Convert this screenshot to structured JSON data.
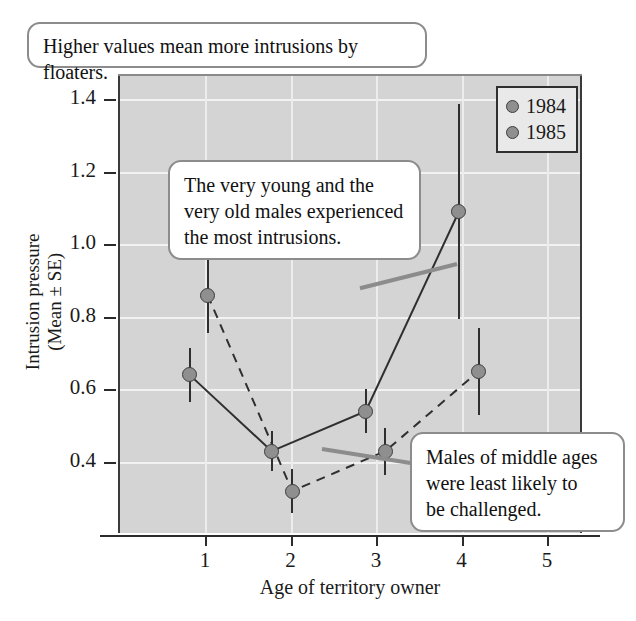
{
  "chart_data": {
    "type": "line",
    "title": "",
    "xlabel": "Age of territory owner",
    "ylabel": "Intrusion pressure\n(Mean ± SE)",
    "ylabel_line1": "Intrusion pressure",
    "ylabel_line2": "(Mean ± SE)",
    "x": [
      1,
      2,
      3,
      4
    ],
    "xticks": [
      "1",
      "2",
      "3",
      "4",
      "5"
    ],
    "yticks": [
      "1.4",
      "1.2",
      "1.0",
      "0.8",
      "0.6",
      "0.4"
    ],
    "xlim": [
      0.45,
      5.35
    ],
    "ylim": [
      0.26,
      1.47
    ],
    "grid": true,
    "legend_position": "top-right",
    "series": [
      {
        "name": "1984",
        "linestyle": "solid",
        "x": [
          0.82,
          1.78,
          2.88,
          3.97
        ],
        "values": [
          0.64,
          0.43,
          0.54,
          1.09
        ],
        "errors": [
          0.075,
          0.055,
          0.06,
          0.295
        ]
      },
      {
        "name": "1985",
        "linestyle": "dashed",
        "x": [
          1.03,
          2.02,
          3.11,
          4.2
        ],
        "values": [
          0.86,
          0.32,
          0.43,
          0.65
        ],
        "errors": [
          0.105,
          0.06,
          0.065,
          0.12
        ]
      }
    ],
    "annotations": [
      {
        "id": "title-callout",
        "text": "Higher values mean more intrusions by floaters."
      },
      {
        "id": "young-callout",
        "lines": [
          "The very young and the",
          "very old males experienced",
          "the most intrusions."
        ],
        "text": "The very young and the very old males experienced the most intrusions."
      },
      {
        "id": "middle-callout",
        "lines": [
          "Males of middle ages",
          "were least likely to",
          "be challenged."
        ],
        "text": "Males of middle ages were least likely to be challenged."
      }
    ],
    "colors": {
      "plot_background": "#d4d4d4",
      "marker_fill": "#8f8f8f",
      "marker_edge": "#3d3d3d",
      "line": "#2f2f2f",
      "gridline": "#f2f2f2",
      "callout_border": "#8c8c8c",
      "text": "#111111"
    }
  },
  "legend": {
    "items": [
      {
        "label": "1984"
      },
      {
        "label": "1985"
      }
    ]
  },
  "axes": {
    "x_title": "Age of territory owner",
    "y_title_line1": "Intrusion pressure",
    "y_title_line2": "(Mean ± SE)",
    "x_tick_labels": [
      "1",
      "2",
      "3",
      "4",
      "5"
    ],
    "y_tick_labels": [
      "1.4",
      "1.2",
      "1.0",
      "0.8",
      "0.6",
      "0.4"
    ]
  },
  "callouts": {
    "top": "Higher values mean more intrusions by floaters.",
    "young_l1": "The very young and the",
    "young_l2": "very old males experienced",
    "young_l3": "the most intrusions.",
    "middle_l1": "Males of middle ages",
    "middle_l2": "were least likely to",
    "middle_l3": "be challenged."
  }
}
